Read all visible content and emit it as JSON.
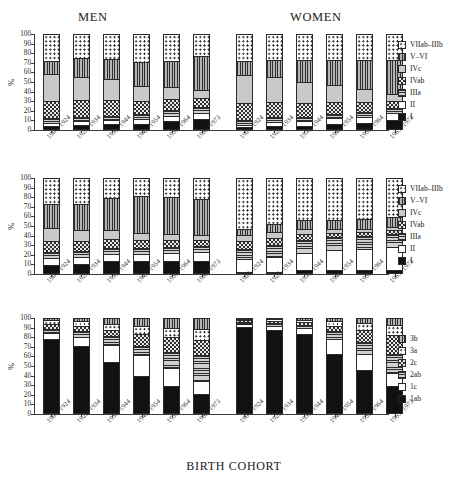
{
  "figure": {
    "group_titles": {
      "men": "MEN",
      "women": "WOMEN"
    },
    "axis_title": "BIRTH COHORT",
    "ylabel": "%",
    "yticks": [
      "100",
      "90",
      "80",
      "70",
      "60",
      "50",
      "40",
      "30",
      "20",
      "10",
      "0"
    ],
    "cohorts": [
      "1906–1924",
      "1925–1934",
      "1935–1944",
      "1945–1954",
      "1955–1964",
      "1965–1973"
    ],
    "legend_a": [
      {
        "label": "VIIab–IIIb",
        "fill": "dots"
      },
      {
        "label": "V–VI",
        "fill": "vlines"
      },
      {
        "label": "IVc",
        "fill": "lgrey"
      },
      {
        "label": "IVab",
        "fill": "check"
      },
      {
        "label": "IIIa",
        "fill": "hlines"
      },
      {
        "label": "II",
        "fill": "white"
      },
      {
        "label": "I",
        "fill": "solid-black"
      }
    ],
    "legend_c": [
      {
        "label": "3b",
        "fill": "vlines"
      },
      {
        "label": "3a",
        "fill": "dots"
      },
      {
        "label": "2c",
        "fill": "check"
      },
      {
        "label": "2ab",
        "fill": "hlines"
      },
      {
        "label": "1c",
        "fill": "open"
      },
      {
        "label": "1ab",
        "fill": "solid-black"
      }
    ]
  },
  "chart_data": [
    {
      "type": "bar",
      "panel": 1,
      "stacked": true,
      "title": "",
      "xlabel": "BIRTH COHORT",
      "ylabel": "%",
      "ylim": [
        0,
        100
      ],
      "grid": false,
      "legend_position": "right",
      "categories": [
        "1906–1924",
        "1925–1934",
        "1935–1944",
        "1945–1954",
        "1955–1964",
        "1965–1973"
      ],
      "groups": [
        "MEN",
        "WOMEN"
      ],
      "series": [
        {
          "name": "I",
          "men": [
            4,
            5,
            6,
            6,
            9,
            11
          ],
          "women": [
            3,
            4,
            4,
            6,
            7,
            10
          ]
        },
        {
          "name": "II",
          "men": [
            3,
            4,
            4,
            5,
            6,
            7
          ],
          "women": [
            2,
            4,
            5,
            6,
            7,
            8
          ]
        },
        {
          "name": "IIIa",
          "men": [
            5,
            5,
            5,
            6,
            6,
            6
          ],
          "women": [
            5,
            5,
            5,
            5,
            5,
            5
          ]
        },
        {
          "name": "IVab",
          "men": [
            18,
            17,
            16,
            13,
            11,
            9
          ],
          "women": [
            18,
            16,
            14,
            12,
            10,
            7
          ]
        },
        {
          "name": "IVc",
          "men": [
            28,
            24,
            22,
            16,
            13,
            9
          ],
          "women": [
            29,
            26,
            22,
            18,
            14,
            7
          ]
        },
        {
          "name": "V–VI",
          "men": [
            14,
            20,
            21,
            25,
            27,
            35
          ],
          "women": [
            15,
            18,
            23,
            26,
            30,
            36
          ]
        },
        {
          "name": "VIIab–IIIb",
          "men": [
            28,
            25,
            26,
            29,
            28,
            23
          ],
          "women": [
            28,
            27,
            27,
            27,
            27,
            27
          ]
        }
      ]
    },
    {
      "type": "bar",
      "panel": 2,
      "stacked": true,
      "title": "",
      "xlabel": "BIRTH COHORT",
      "ylabel": "%",
      "ylim": [
        0,
        100
      ],
      "grid": false,
      "legend_position": "right",
      "categories": [
        "1906–1924",
        "1925–1934",
        "1935–1944",
        "1945–1954",
        "1955–1964",
        "1965–1973"
      ],
      "groups": [
        "MEN",
        "WOMEN"
      ],
      "series": [
        {
          "name": "I",
          "men": [
            9,
            10,
            13,
            13,
            14,
            14
          ],
          "women": [
            2,
            2,
            4,
            4,
            4,
            4
          ]
        },
        {
          "name": "II",
          "men": [
            8,
            8,
            8,
            8,
            8,
            9
          ],
          "women": [
            14,
            16,
            18,
            21,
            22,
            24
          ]
        },
        {
          "name": "IIIa",
          "men": [
            6,
            6,
            6,
            6,
            6,
            6
          ],
          "women": [
            10,
            12,
            13,
            13,
            14,
            14
          ]
        },
        {
          "name": "IVab",
          "men": [
            11,
            10,
            9,
            8,
            7,
            6
          ],
          "women": [
            8,
            8,
            7,
            5,
            4,
            4
          ]
        },
        {
          "name": "IVc",
          "men": [
            14,
            12,
            10,
            8,
            7,
            6
          ],
          "women": [
            7,
            6,
            5,
            4,
            3,
            3
          ]
        },
        {
          "name": "V–VI",
          "men": [
            25,
            27,
            33,
            38,
            38,
            37
          ],
          "women": [
            6,
            8,
            9,
            9,
            10,
            10
          ]
        },
        {
          "name": "VIIab–IIIb",
          "men": [
            27,
            27,
            21,
            19,
            20,
            22
          ],
          "women": [
            53,
            48,
            44,
            44,
            43,
            41
          ]
        }
      ]
    },
    {
      "type": "bar",
      "panel": 3,
      "stacked": true,
      "title": "",
      "xlabel": "BIRTH COHORT",
      "ylabel": "%",
      "ylim": [
        0,
        100
      ],
      "grid": false,
      "legend_position": "right",
      "categories": [
        "1906–1924",
        "1925–1934",
        "1935–1944",
        "1945–1954",
        "1955–1964",
        "1965–1973"
      ],
      "groups": [
        "MEN",
        "WOMEN"
      ],
      "series": [
        {
          "name": "1ab",
          "men": [
            78,
            71,
            54,
            40,
            29,
            21
          ],
          "women": [
            91,
            87,
            83,
            62,
            46,
            29
          ]
        },
        {
          "name": "1c",
          "men": [
            6,
            9,
            18,
            21,
            19,
            13
          ],
          "women": [
            3,
            5,
            7,
            16,
            16,
            14
          ]
        },
        {
          "name": "2ab",
          "men": [
            5,
            6,
            9,
            10,
            17,
            27
          ],
          "women": [
            2,
            3,
            3,
            8,
            13,
            19
          ]
        },
        {
          "name": "2c",
          "men": [
            5,
            6,
            7,
            12,
            15,
            16
          ],
          "women": [
            2,
            2,
            3,
            6,
            12,
            20
          ]
        },
        {
          "name": "3a",
          "men": [
            4,
            5,
            6,
            9,
            10,
            12
          ],
          "women": [
            1,
            2,
            2,
            5,
            8,
            11
          ]
        },
        {
          "name": "3b",
          "men": [
            2,
            3,
            6,
            8,
            10,
            11
          ],
          "women": [
            1,
            1,
            2,
            3,
            5,
            7
          ]
        }
      ]
    }
  ]
}
